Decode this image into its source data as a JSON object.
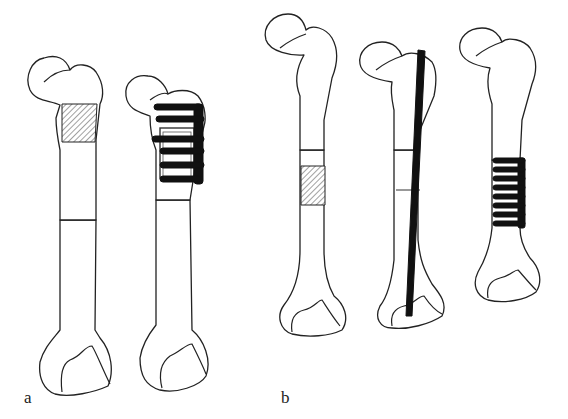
{
  "figure": {
    "panels": [
      {
        "label": "a",
        "bones": [
          {
            "id": "a1",
            "description": "Proximal femur with hatched resection segment"
          },
          {
            "id": "a2",
            "description": "Proximal femur reconstructed with plate and screws"
          }
        ]
      },
      {
        "label": "b",
        "bones": [
          {
            "id": "b1",
            "description": "Femur with hatched diaphyseal segment"
          },
          {
            "id": "b2",
            "description": "Femur with intramedullary nail"
          },
          {
            "id": "b3",
            "description": "Femur with plate and screws in diaphysis"
          }
        ]
      }
    ],
    "colors": {
      "outline": "#222222",
      "implant": "#111111",
      "background": "#ffffff"
    }
  }
}
